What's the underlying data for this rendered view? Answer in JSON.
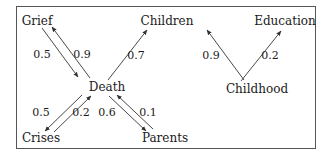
{
  "diagram": {
    "type": "weighted-directed-graph",
    "nodes": [
      {
        "id": "grief",
        "label": "Grief",
        "x": 37,
        "y": 21
      },
      {
        "id": "children",
        "label": "Children",
        "x": 167,
        "y": 21
      },
      {
        "id": "education",
        "label": "Education",
        "x": 285,
        "y": 21
      },
      {
        "id": "death",
        "label": "Death",
        "x": 107,
        "y": 87
      },
      {
        "id": "childhood",
        "label": "Childhood",
        "x": 257,
        "y": 89
      },
      {
        "id": "crises",
        "label": "Crises",
        "x": 41,
        "y": 138
      },
      {
        "id": "parents",
        "label": "Parents",
        "x": 165,
        "y": 138
      }
    ],
    "edges": [
      {
        "from": "grief",
        "to": "death",
        "weight": "0.5",
        "label_x": 42,
        "label_y": 55
      },
      {
        "from": "death",
        "to": "grief",
        "weight": "0.9",
        "label_x": 82,
        "label_y": 55
      },
      {
        "from": "death",
        "to": "children",
        "weight": "0.7",
        "label_x": 136,
        "label_y": 56
      },
      {
        "from": "childhood",
        "to": "children",
        "weight": "0.9",
        "label_x": 211,
        "label_y": 56
      },
      {
        "from": "childhood",
        "to": "education",
        "weight": "0.2",
        "label_x": 270,
        "label_y": 56
      },
      {
        "from": "death",
        "to": "crises",
        "weight": "0.5",
        "label_x": 41,
        "label_y": 113
      },
      {
        "from": "crises",
        "to": "death",
        "weight": "0.2",
        "label_x": 81,
        "label_y": 113
      },
      {
        "from": "death",
        "to": "parents",
        "weight": "0.6",
        "label_x": 107,
        "label_y": 113
      },
      {
        "from": "parents",
        "to": "death",
        "weight": "0.1",
        "label_x": 148,
        "label_y": 113
      }
    ],
    "colors": {
      "line": "#333333",
      "frame": "#555555",
      "text": "#1a1a1a"
    }
  }
}
